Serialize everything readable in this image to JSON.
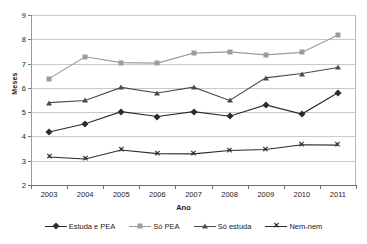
{
  "chart_data": {
    "type": "line",
    "title": "",
    "xlabel": "Ano",
    "ylabel": "Meses",
    "categories": [
      "2003",
      "2004",
      "2005",
      "2006",
      "2007",
      "2008",
      "2009",
      "2010",
      "2011"
    ],
    "ylim": [
      2,
      9
    ],
    "yticks": [
      2,
      3,
      4,
      5,
      6,
      7,
      8,
      9
    ],
    "grid": true,
    "legend_position": "bottom",
    "series": [
      {
        "name": "Estuda e PEA",
        "marker": "diamond",
        "color": "#2b2b2b",
        "values": [
          4.18,
          4.52,
          5.02,
          4.82,
          5.02,
          4.83,
          5.3,
          4.92,
          5.8
        ]
      },
      {
        "name": "Só PEA",
        "marker": "square",
        "color": "#9b9b9b",
        "values": [
          6.38,
          7.28,
          7.04,
          7.02,
          7.43,
          7.48,
          7.36,
          7.46,
          8.18
        ]
      },
      {
        "name": "Só estuda",
        "marker": "triangle",
        "color": "#4a4a4a",
        "values": [
          5.39,
          5.48,
          6.02,
          5.79,
          6.03,
          5.48,
          6.41,
          6.59,
          6.84
        ]
      },
      {
        "name": "Nem-nem",
        "marker": "x",
        "color": "#2b2b2b",
        "values": [
          3.15,
          3.07,
          3.44,
          3.29,
          3.28,
          3.42,
          3.46,
          3.66,
          3.64
        ]
      }
    ]
  }
}
